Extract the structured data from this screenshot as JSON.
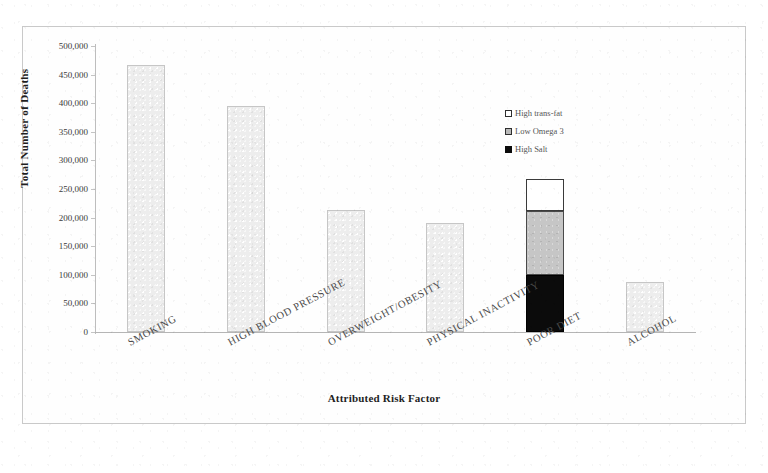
{
  "chart_data": {
    "type": "bar",
    "title": "",
    "xlabel": "Attributed Risk Factor",
    "ylabel": "Total Number of Deaths",
    "ylim": [
      0,
      500000
    ],
    "yticks": [
      "0",
      "50,000",
      "100,000",
      "150,000",
      "200,000",
      "250,000",
      "300,000",
      "350,000",
      "400,000",
      "450,000",
      "500,000"
    ],
    "ytick_values": [
      0,
      50000,
      100000,
      150000,
      200000,
      250000,
      300000,
      350000,
      400000,
      450000,
      500000
    ],
    "grid": false,
    "legend_position": "upper-right-inside",
    "categories": [
      "SMOKING",
      "HIGH BLOOD PRESSURE",
      "OVERWEIGHT/OBESITY",
      "PHYSICAL INACTIVITY",
      "POOR DIET",
      "ALCOHOL"
    ],
    "values": [
      467000,
      395000,
      213000,
      190000,
      268000,
      88000
    ],
    "stacked_category": "POOR DIET",
    "series": [
      {
        "name": "High Salt",
        "color": "#0b0b0b",
        "values": [
          null,
          null,
          null,
          null,
          100000,
          null
        ]
      },
      {
        "name": "Low Omega 3",
        "color": "#c6c6c6",
        "values": [
          null,
          null,
          null,
          null,
          112000,
          null
        ]
      },
      {
        "name": "High trans-fat",
        "color": "#ffffff",
        "values": [
          null,
          null,
          null,
          null,
          56000,
          null
        ]
      }
    ],
    "bars": [
      {
        "category": "SMOKING",
        "total": 467000,
        "style": "light",
        "segments": [
          {
            "label": "",
            "from": 0,
            "to": 467000,
            "style": "light"
          }
        ]
      },
      {
        "category": "HIGH BLOOD PRESSURE",
        "total": 395000,
        "style": "light",
        "segments": [
          {
            "label": "",
            "from": 0,
            "to": 395000,
            "style": "light"
          }
        ]
      },
      {
        "category": "OVERWEIGHT/OBESITY",
        "total": 213000,
        "style": "light",
        "segments": [
          {
            "label": "",
            "from": 0,
            "to": 213000,
            "style": "light"
          }
        ]
      },
      {
        "category": "PHYSICAL INACTIVITY",
        "total": 190000,
        "style": "light",
        "segments": [
          {
            "label": "",
            "from": 0,
            "to": 190000,
            "style": "light"
          }
        ]
      },
      {
        "category": "POOR DIET",
        "total": 268000,
        "style": "stacked",
        "segments": [
          {
            "label": "High Salt",
            "from": 0,
            "to": 100000,
            "style": "black"
          },
          {
            "label": "Low Omega 3",
            "from": 100000,
            "to": 212000,
            "style": "gray"
          },
          {
            "label": "High trans-fat",
            "from": 212000,
            "to": 268000,
            "style": "white"
          }
        ]
      },
      {
        "category": "ALCOHOL",
        "total": 88000,
        "style": "light",
        "segments": [
          {
            "label": "",
            "from": 0,
            "to": 88000,
            "style": "light"
          }
        ]
      }
    ],
    "legend": [
      {
        "label": "High trans-fat",
        "swatch": "white"
      },
      {
        "label": "Low Omega 3",
        "swatch": "gray"
      },
      {
        "label": "High Salt",
        "swatch": "black"
      }
    ]
  }
}
